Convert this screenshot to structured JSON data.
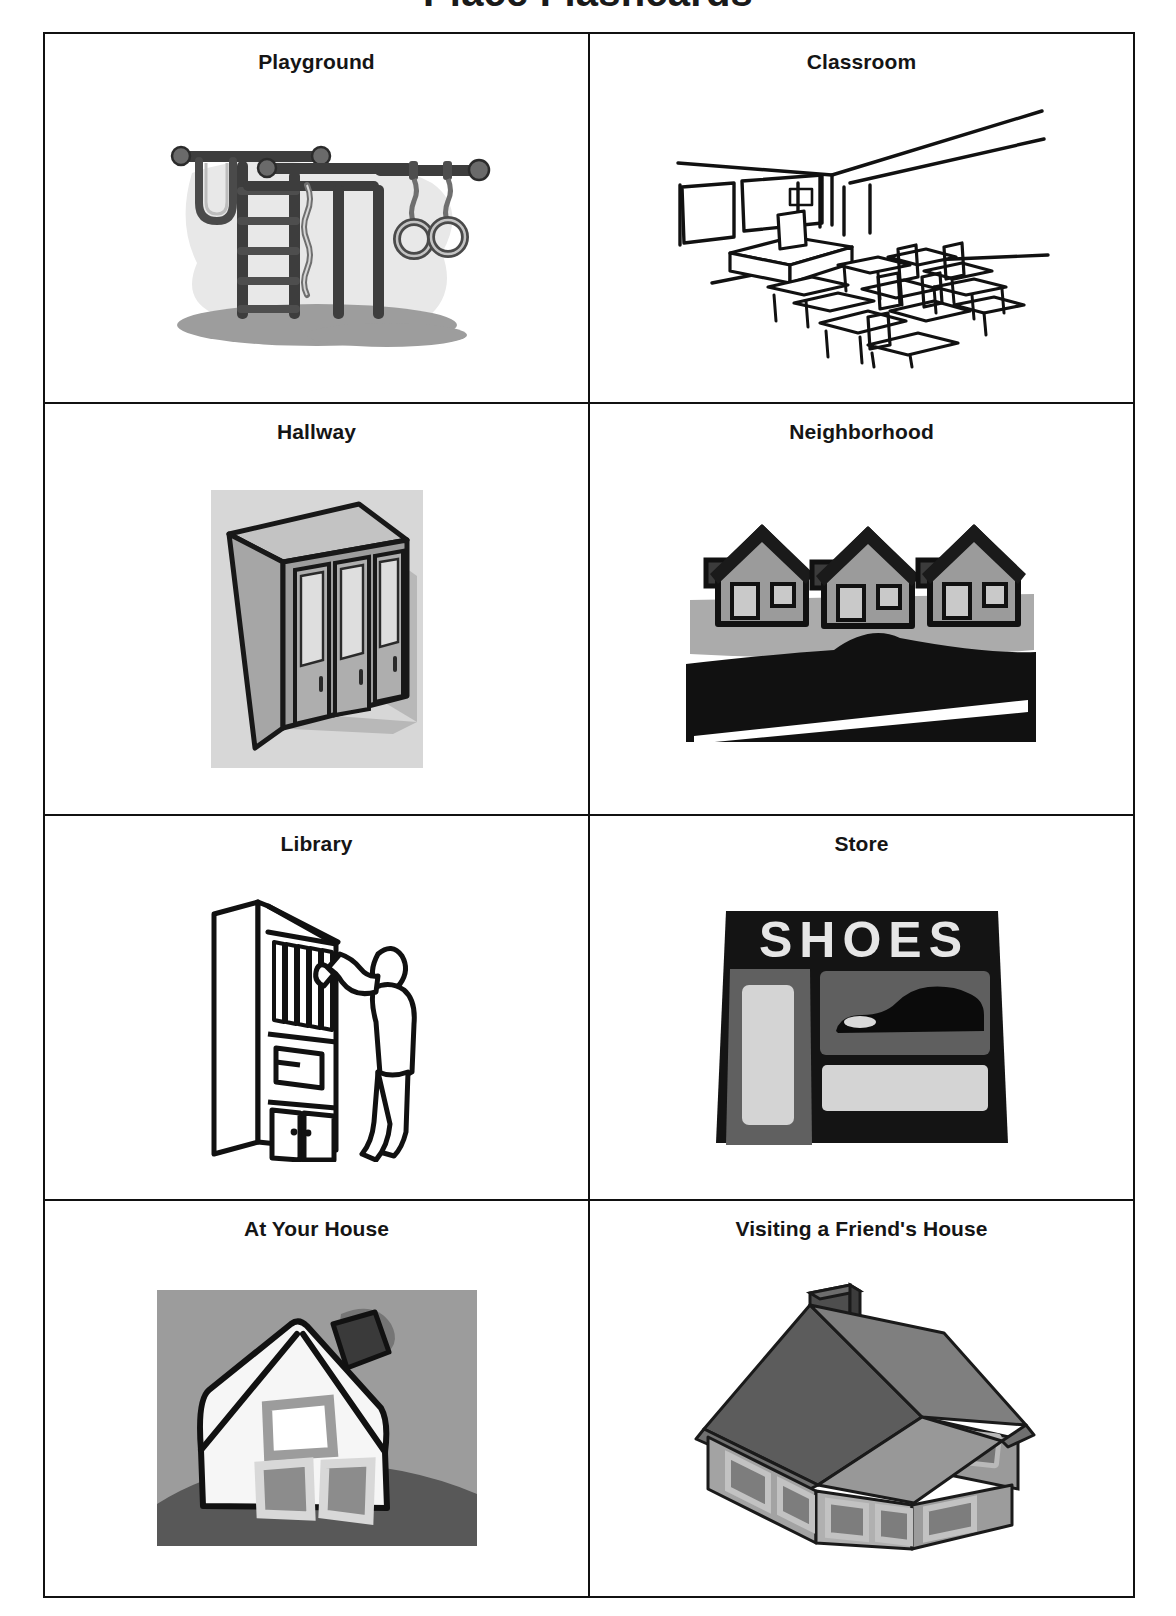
{
  "page": {
    "title": "Place Flashcards"
  },
  "grid": {
    "columns": 2,
    "rows": 4,
    "cards": [
      {
        "label": "Playground",
        "art": "playground-climbing-frame-illustration",
        "colors": {
          "line": "#3a3a3a",
          "fill": "#5c5c5c",
          "backdrop": "#e3e3e3",
          "shadow": "#9a9a9a"
        }
      },
      {
        "label": "Classroom",
        "art": "classroom-desks-and-chairs-line-drawing",
        "colors": {
          "line": "#111111",
          "fill": "#ffffff"
        }
      },
      {
        "label": "Hallway",
        "art": "school-lockers-illustration",
        "colors": {
          "line": "#1a1a1a",
          "body": "#9e9e9e",
          "door": "#b5b5b5",
          "vent": "#dcdcdc",
          "backdrop": "#d4d4d4"
        }
      },
      {
        "label": "Neighborhood",
        "art": "three-houses-with-road-illustration",
        "colors": {
          "line": "#111111",
          "house": "#9b9b9b",
          "window": "#c9c9c9",
          "ground": "#b0b0b0",
          "road": "#111111",
          "stripe": "#ffffff"
        }
      },
      {
        "label": "Library",
        "art": "person-at-bookshelf-line-drawing",
        "colors": {
          "line": "#111111",
          "fill": "#ffffff"
        }
      },
      {
        "label": "Store",
        "art": "shoe-store-front-illustration",
        "sign_text": "SHOES",
        "colors": {
          "facade": "#111111",
          "panel": "#5e5e5e",
          "window": "#d2d2d2",
          "sign_text": "#e8e8e8",
          "shoe": "#0d0d0d"
        }
      },
      {
        "label": "At Your House",
        "art": "cottage-house-on-hill-illustration",
        "colors": {
          "sky": "#9c9c9c",
          "house": "#f4f4f4",
          "roof": "#4a4a4a",
          "window": "#8e8e8e",
          "hill": "#5a5a5a",
          "line": "#111111"
        }
      },
      {
        "label": "Visiting a Friend's House",
        "art": "isometric-house-illustration",
        "colors": {
          "roof_dark": "#5b5b5b",
          "roof_light": "#8a8a8a",
          "wall": "#a8a8a8",
          "wall_shade": "#8f8f8f",
          "window": "#7a7a7a",
          "chimney": "#4f4f4f",
          "line": "#1a1a1a"
        }
      }
    ]
  }
}
